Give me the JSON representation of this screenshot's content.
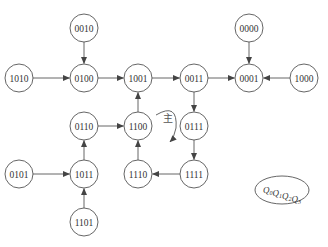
{
  "diagram": {
    "type": "state-transition-diagram",
    "nodes": [
      {
        "id": "0010",
        "label": "0010",
        "x": 84,
        "y": 28
      },
      {
        "id": "0000",
        "label": "0000",
        "x": 249,
        "y": 28
      },
      {
        "id": "1010",
        "label": "1010",
        "x": 19,
        "y": 78
      },
      {
        "id": "0100",
        "label": "0100",
        "x": 84,
        "y": 78
      },
      {
        "id": "1001",
        "label": "1001",
        "x": 138,
        "y": 78
      },
      {
        "id": "0011",
        "label": "0011",
        "x": 194,
        "y": 78
      },
      {
        "id": "0001",
        "label": "0001",
        "x": 249,
        "y": 78
      },
      {
        "id": "1000",
        "label": "1000",
        "x": 304,
        "y": 78
      },
      {
        "id": "0110",
        "label": "0110",
        "x": 84,
        "y": 126
      },
      {
        "id": "1100",
        "label": "1100",
        "x": 138,
        "y": 126
      },
      {
        "id": "0111",
        "label": "0111",
        "x": 194,
        "y": 126
      },
      {
        "id": "0101",
        "label": "0101",
        "x": 19,
        "y": 174
      },
      {
        "id": "1011",
        "label": "1011",
        "x": 84,
        "y": 174
      },
      {
        "id": "1110",
        "label": "1110",
        "x": 138,
        "y": 174
      },
      {
        "id": "1111",
        "label": "1111",
        "x": 194,
        "y": 174
      },
      {
        "id": "1101",
        "label": "1101",
        "x": 84,
        "y": 222
      }
    ],
    "edges": [
      {
        "from": "0010",
        "to": "0100"
      },
      {
        "from": "1010",
        "to": "0100"
      },
      {
        "from": "0100",
        "to": "1001"
      },
      {
        "from": "1001",
        "to": "0011"
      },
      {
        "from": "0011",
        "to": "0001"
      },
      {
        "from": "0000",
        "to": "0001"
      },
      {
        "from": "1000",
        "to": "0001"
      },
      {
        "from": "0011",
        "to": "0111"
      },
      {
        "from": "0111",
        "to": "1111"
      },
      {
        "from": "1111",
        "to": "1110"
      },
      {
        "from": "1110",
        "to": "1100"
      },
      {
        "from": "1100",
        "to": "1001"
      },
      {
        "from": "0110",
        "to": "1100"
      },
      {
        "from": "1011",
        "to": "0110"
      },
      {
        "from": "0101",
        "to": "1011"
      },
      {
        "from": "1101",
        "to": "1011"
      }
    ],
    "loop_annotation": {
      "label": "主",
      "x": 168,
      "y": 120
    },
    "legend": {
      "label": "Q0Q1Q2Q3",
      "base": "Q",
      "subscripts": [
        "0",
        "1",
        "2",
        "3"
      ],
      "x": 282,
      "y": 190
    },
    "node_radius": 14,
    "stroke_color": "#555555"
  }
}
